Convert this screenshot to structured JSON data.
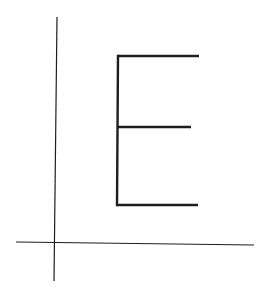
{
  "diagram": {
    "background": "#ffffff",
    "stroke_color": "#1e1e1e",
    "axes": {
      "x_axis": {
        "x1": 16,
        "y1": 242,
        "x2": 254,
        "y2": 245,
        "width": 1.2
      },
      "y_axis": {
        "x1": 57,
        "y1": 17,
        "x2": 54,
        "y2": 281,
        "width": 1.2
      }
    },
    "letter": {
      "glyph": "E",
      "stroke_width": 2.4,
      "spine": {
        "x1": 118,
        "y1": 56,
        "x2": 117,
        "y2": 205
      },
      "top_bar": {
        "x1": 118,
        "y1": 56,
        "x2": 199,
        "y2": 56
      },
      "middle_bar": {
        "x1": 118,
        "y1": 127,
        "x2": 191,
        "y2": 127
      },
      "bottom_bar": {
        "x1": 117,
        "y1": 205,
        "x2": 198,
        "y2": 205
      }
    }
  }
}
